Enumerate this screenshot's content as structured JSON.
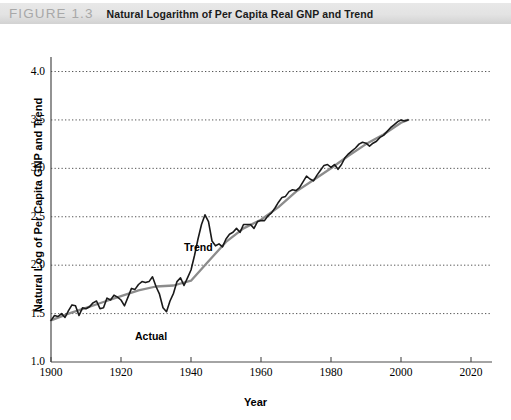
{
  "figure": {
    "number": "FIGURE 1.3",
    "title": "Natural Logarithm of Per Capita Real GNP and Trend"
  },
  "colors": {
    "actual_line": "#1a1a1a",
    "trend_line": "#8c8c8c",
    "gridline": "#555555",
    "axis": "#4a4a4a",
    "header_bar": "#e3e3e3",
    "figure_number_text": "#a8a8a8"
  },
  "chart_data": {
    "type": "line",
    "title": "Natural Logarithm of Per Capita Real GNP and Trend",
    "xlabel": "Year",
    "ylabel": "Natural Log of Per Capita GNP and Trend",
    "xlim": [
      1900,
      2026
    ],
    "ylim": [
      1.0,
      4.15
    ],
    "xticks": [
      1900,
      1920,
      1940,
      1960,
      1980,
      2000,
      2020
    ],
    "xticklabels": [
      "1900",
      "1920",
      "1940",
      "1960",
      "1980",
      "2000",
      "2020"
    ],
    "yticks": [
      1.0,
      1.5,
      2.0,
      2.5,
      3.0,
      3.5,
      4.0
    ],
    "yticklabels": [
      "1.0",
      "1.5",
      "2.0",
      "2.5",
      "3.0",
      "3.5",
      "4.0"
    ],
    "grid": "horizontal-dotted",
    "legend": "in-plot-annotations",
    "annotations": [
      {
        "text": "Trend",
        "x": 1938,
        "y": 2.18
      },
      {
        "text": "Actual",
        "x": 1924,
        "y": 1.26
      }
    ],
    "series": [
      {
        "name": "Actual",
        "color": "#1a1a1a",
        "x": [
          1900,
          1901,
          1902,
          1903,
          1904,
          1905,
          1906,
          1907,
          1908,
          1909,
          1910,
          1911,
          1912,
          1913,
          1914,
          1915,
          1916,
          1917,
          1918,
          1919,
          1920,
          1921,
          1922,
          1923,
          1924,
          1925,
          1926,
          1927,
          1928,
          1929,
          1930,
          1931,
          1932,
          1933,
          1934,
          1935,
          1936,
          1937,
          1938,
          1939,
          1940,
          1941,
          1942,
          1943,
          1944,
          1945,
          1946,
          1947,
          1948,
          1949,
          1950,
          1951,
          1952,
          1953,
          1954,
          1955,
          1956,
          1957,
          1958,
          1959,
          1960,
          1961,
          1962,
          1963,
          1964,
          1965,
          1966,
          1967,
          1968,
          1969,
          1970,
          1971,
          1972,
          1973,
          1974,
          1975,
          1976,
          1977,
          1978,
          1979,
          1980,
          1981,
          1982,
          1983,
          1984,
          1985,
          1986,
          1987,
          1988,
          1989,
          1990,
          1991,
          1992,
          1993,
          1994,
          1995,
          1996,
          1997,
          1998,
          1999,
          2000,
          2001,
          2002
        ],
        "y": [
          1.43,
          1.48,
          1.47,
          1.5,
          1.46,
          1.53,
          1.59,
          1.58,
          1.48,
          1.56,
          1.55,
          1.57,
          1.61,
          1.63,
          1.55,
          1.56,
          1.66,
          1.64,
          1.69,
          1.67,
          1.64,
          1.58,
          1.67,
          1.76,
          1.75,
          1.8,
          1.83,
          1.82,
          1.83,
          1.88,
          1.78,
          1.7,
          1.56,
          1.52,
          1.63,
          1.71,
          1.83,
          1.87,
          1.79,
          1.87,
          1.95,
          2.1,
          2.27,
          2.42,
          2.52,
          2.45,
          2.25,
          2.2,
          2.22,
          2.19,
          2.27,
          2.32,
          2.34,
          2.38,
          2.34,
          2.42,
          2.42,
          2.42,
          2.38,
          2.45,
          2.46,
          2.46,
          2.51,
          2.54,
          2.59,
          2.65,
          2.7,
          2.71,
          2.76,
          2.78,
          2.77,
          2.8,
          2.86,
          2.92,
          2.89,
          2.87,
          2.93,
          2.98,
          3.03,
          3.04,
          3.01,
          3.04,
          2.99,
          3.04,
          3.11,
          3.15,
          3.18,
          3.21,
          3.25,
          3.27,
          3.26,
          3.23,
          3.26,
          3.28,
          3.32,
          3.34,
          3.38,
          3.42,
          3.45,
          3.48,
          3.5,
          3.49,
          3.5
        ]
      },
      {
        "name": "Trend",
        "color": "#8c8c8c",
        "x": [
          1900,
          1905,
          1910,
          1915,
          1920,
          1925,
          1930,
          1935,
          1940,
          1945,
          1950,
          1955,
          1960,
          1965,
          1970,
          1975,
          1980,
          1985,
          1990,
          1995,
          2000,
          2002
        ],
        "y": [
          1.43,
          1.5,
          1.56,
          1.62,
          1.68,
          1.74,
          1.78,
          1.79,
          1.84,
          2.04,
          2.24,
          2.38,
          2.47,
          2.6,
          2.76,
          2.88,
          3.0,
          3.13,
          3.25,
          3.35,
          3.47,
          3.5
        ]
      }
    ]
  },
  "axis_geometry": {
    "plot_left_px": 51,
    "plot_right_px": 492,
    "plot_top_px": 33,
    "plot_bottom_px": 338
  }
}
